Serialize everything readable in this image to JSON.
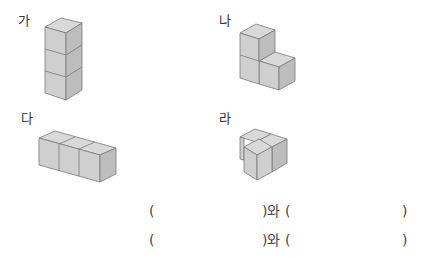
{
  "figures": [
    {
      "label": "가",
      "name": "stack-of-three-cubes"
    },
    {
      "label": "나",
      "name": "l-shape-three-cubes"
    },
    {
      "label": "다",
      "name": "row-of-three-cubes"
    },
    {
      "label": "라",
      "name": "l-flat-three-cubes"
    }
  ],
  "answers": [
    {
      "open1": "(",
      "close_with": ")와 (",
      "close2": ")"
    },
    {
      "open1": "(",
      "close_with": ")와 (",
      "close2": ")"
    }
  ],
  "colors": {
    "top": "#d9d9d9",
    "front": "#cfcfcf",
    "side": "#bdbdbd",
    "edge": "#7a7a7a"
  }
}
